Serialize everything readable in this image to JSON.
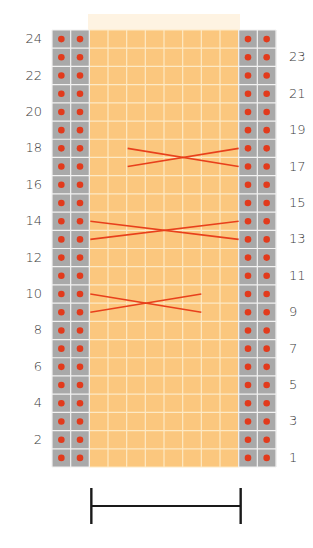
{
  "diagram": {
    "type": "knitting-chart",
    "rows": 24,
    "columns": 12,
    "grid": {
      "left": 52,
      "top": 30,
      "width": 224,
      "height": 437
    },
    "column_types": [
      "edge",
      "edge",
      "main",
      "main",
      "main",
      "main",
      "main",
      "main",
      "main",
      "main",
      "edge",
      "edge"
    ],
    "colors": {
      "main_fill": "#FBC77E",
      "main_gridline": "#FDE9C4",
      "edge_fill": "#A9A9A9",
      "edge_gridline": "#F2F2F2",
      "dot": "#E23A1C",
      "cable_line": "#E8401C",
      "label_text": "#3a3a3a",
      "bracket": "#1a1a1a"
    },
    "edge_stitch_symbol": "dot",
    "left_labels": [
      "24",
      "22",
      "20",
      "18",
      "16",
      "14",
      "12",
      "10",
      "8",
      "6",
      "4",
      "2"
    ],
    "right_labels": [
      "23",
      "21",
      "19",
      "17",
      "15",
      "13",
      "11",
      "9",
      "7",
      "5",
      "3",
      "1"
    ],
    "cables": [
      {
        "name": "cable-rows-17-18",
        "rows": [
          17,
          18
        ],
        "from_col": 4,
        "to_col": 10
      },
      {
        "name": "cable-rows-13-14",
        "rows": [
          13,
          14
        ],
        "from_col": 2,
        "to_col": 10
      },
      {
        "name": "cable-rows-9-10",
        "rows": [
          9,
          10
        ],
        "from_col": 2,
        "to_col": 8
      }
    ],
    "repeat_bracket": {
      "from_col": 2,
      "to_col": 10,
      "description": "pattern repeat"
    }
  }
}
